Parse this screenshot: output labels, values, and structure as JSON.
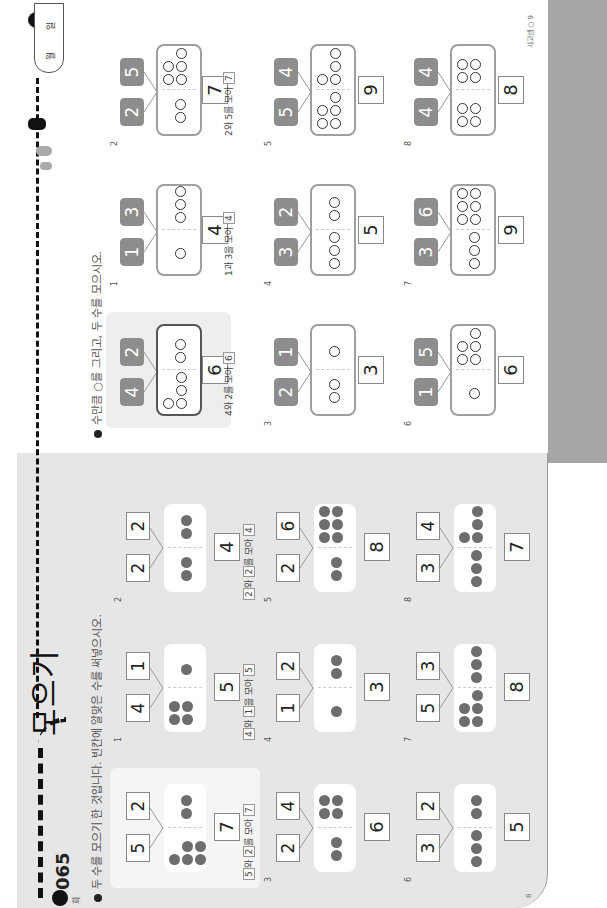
{
  "lesson": {
    "number": "065",
    "badge_small": "회",
    "title": "모으기"
  },
  "left_page": {
    "instruction": "두 수를 모으기 한 것입니다. 빈칸에 알맞은 수를 써넣으시오.",
    "problems": [
      {
        "label": "example",
        "a": "5",
        "b": "2",
        "total": "7",
        "sentence": [
          "5",
          "와 ",
          "2",
          "를 모아 ",
          "7"
        ]
      },
      {
        "label": "1",
        "a": "4",
        "b": "1",
        "total": "5",
        "sentence": [
          "4",
          "와 ",
          "1",
          "을 모아 ",
          "5"
        ]
      },
      {
        "label": "2",
        "a": "2",
        "b": "2",
        "total": "4",
        "sentence": [
          "2",
          "와 ",
          "2",
          "를 모아 ",
          "4"
        ]
      },
      {
        "label": "3",
        "a": "2",
        "b": "4",
        "total": "6"
      },
      {
        "label": "4",
        "a": "1",
        "b": "2",
        "total": "3"
      },
      {
        "label": "5",
        "a": "2",
        "b": "6",
        "total": "8"
      },
      {
        "label": "6",
        "a": "3",
        "b": "2",
        "total": "5"
      },
      {
        "label": "7",
        "a": "5",
        "b": "3",
        "total": "8"
      },
      {
        "label": "8",
        "a": "3",
        "b": "4",
        "total": "7"
      }
    ],
    "page_number": "8"
  },
  "right_page": {
    "instruction": "수만큼 ○를 그리고, 두 수를 모으시오.",
    "problems": [
      {
        "label": "example",
        "a": "4",
        "b": "2",
        "total": "6",
        "sentence": [
          "4",
          "와 ",
          "2",
          "를 모아 ",
          "6"
        ]
      },
      {
        "label": "1",
        "a": "1",
        "b": "3",
        "total": "4",
        "sentence": [
          "1",
          "과 ",
          "3",
          "을 모아 ",
          "4"
        ]
      },
      {
        "label": "2",
        "a": "2",
        "b": "5",
        "total": "7",
        "sentence": [
          "2",
          "와 ",
          "5",
          "를 모아 ",
          "7"
        ]
      },
      {
        "label": "3",
        "a": "2",
        "b": "1",
        "total": "3"
      },
      {
        "label": "4",
        "a": "3",
        "b": "2",
        "total": "5"
      },
      {
        "label": "5",
        "a": "5",
        "b": "4",
        "total": "9"
      },
      {
        "label": "6",
        "a": "1",
        "b": "5",
        "total": "6"
      },
      {
        "label": "7",
        "a": "3",
        "b": "6",
        "total": "9"
      },
      {
        "label": "8",
        "a": "4",
        "b": "4",
        "total": "8"
      }
    ],
    "footer": "사고셈 ○ 9",
    "tab": {
      "month": "월",
      "day": "일"
    }
  },
  "colors": {
    "left_bg": "#e6e6e6",
    "dot": "#6d6d6d",
    "number_tile": "#8d8d8d",
    "track": "#111111",
    "spine": "#a6a6a6"
  }
}
